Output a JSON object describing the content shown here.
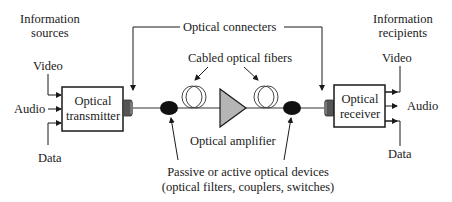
{
  "diagram": {
    "left_header": [
      "Information",
      "sources"
    ],
    "right_header": [
      "Information",
      "recipients"
    ],
    "inputs": [
      "Video",
      "Audio",
      "Data"
    ],
    "outputs": [
      "Video",
      "Audio",
      "Data"
    ],
    "transmitter": [
      "Optical",
      "transmitter"
    ],
    "receiver": [
      "Optical",
      "receiver"
    ],
    "connectors_label": "Optical connecters",
    "fibers_label": "Cabled optical fibers",
    "amplifier_label": "Optical amplifier",
    "devices_label": [
      "Passive or active optical devices",
      "(optical filters, couplers, switches)"
    ],
    "colors": {
      "line": "#1a1a1a",
      "connector": "#555555",
      "device": "#111111",
      "amplifier_fill": "#b5b5b5"
    }
  }
}
